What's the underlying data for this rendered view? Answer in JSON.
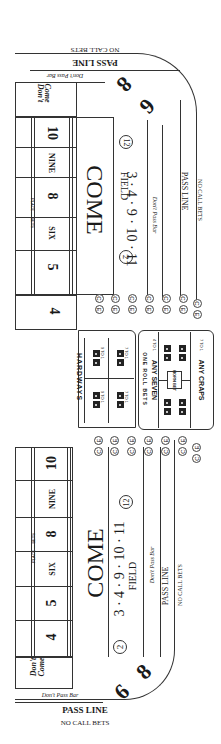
{
  "table": {
    "title": "Craps Table Layout",
    "top_half": {
      "pass_line": "PASS LINE",
      "no_call_bets": "NO CALL BETS",
      "dont_pass_bar": "Don't Pass Bar",
      "dont_come_bar": [
        "Don't",
        "Come",
        "Bar"
      ],
      "big_six": "6",
      "big_eight": "8",
      "big_label": "Big 6 & 8",
      "place_numbers": [
        "4",
        "5",
        "SIX",
        "8",
        "NINE",
        "10"
      ],
      "place_bets_label": "PLACE — BETS",
      "come": "COME",
      "field_numbers": "3 · 4 · 9 · 10 · 11",
      "field": "FIELD",
      "field_double_2": "2",
      "field_double_12": "12",
      "pays_double": "Pays Double"
    },
    "bottom_half": {
      "pass_line": "PASS LINE",
      "no_call_bets": "NO CALL BETS",
      "dont_pass_bar": "Don't Pass Bar",
      "dont_come_bar": [
        "Don't",
        "Come",
        "Bar"
      ],
      "big_six": "6",
      "big_eight": "8",
      "big_label": "Big 6 & 8",
      "place_numbers": [
        "4",
        "5",
        "SIX",
        "8",
        "NINE",
        "10"
      ],
      "place_bets_label": "PLACE — BETS",
      "come": "COME",
      "field_numbers": "3 · 4 · 9 · 10 · 11",
      "field": "FIELD",
      "field_double_2": "2",
      "field_double_12": "12",
      "pays_double": "Pays Double"
    },
    "center": {
      "hardways": "HARDWAYS",
      "hardways_odds": [
        "9 TO 1",
        "7 TO 1",
        "9 TO 1",
        "7 TO 1"
      ],
      "one_roll_bets": "ONE ROLL BETS",
      "any_seven": "ANY SEVEN",
      "any_seven_odds": "4 TO 1",
      "horn_bet": "HORN BET",
      "horn_odds": [
        "30 TO 1",
        "15 TO 1",
        "30 TO 1",
        "15 TO 1"
      ],
      "any_craps": "ANY CRAPS",
      "any_craps_odds": "7 TO 1",
      "ce_label_c": "C",
      "ce_label_e": "E"
    }
  }
}
